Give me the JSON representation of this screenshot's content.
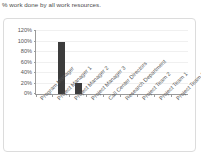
{
  "report": {
    "title": "% work done by all work resources."
  },
  "chart_data": {
    "type": "bar",
    "title": "% work done by all work resources.",
    "xlabel": "",
    "ylabel": "",
    "categories": [
      "Program Manager",
      "Project Manager 1",
      "Project Manager 2",
      "Project Manager 3",
      "Call Center Directors",
      "Research Department",
      "Project Team 2",
      "Project Team 1",
      "Project Team 3"
    ],
    "values": [
      0,
      100,
      21,
      0,
      0,
      0,
      0,
      0,
      0
    ],
    "value_suffix": "%",
    "ylim": [
      0,
      120
    ],
    "yticks": [
      "0%",
      "20%",
      "40%",
      "60%",
      "80%",
      "100%",
      "120%"
    ],
    "ytick_values": [
      0,
      20,
      40,
      60,
      80,
      100,
      120
    ],
    "grid": true,
    "legend": false,
    "bar_color": "#3c3c3c",
    "axis_color": "#9a9a9a",
    "grid_color": "#f0f0f0"
  }
}
